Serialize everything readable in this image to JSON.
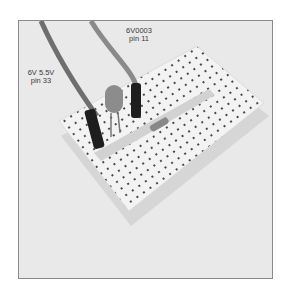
{
  "photo": {
    "subject": "Breadboard with LED, resistor and two jumper wires",
    "labels": [
      {
        "line1": "6V0003",
        "line2": "pin 11"
      },
      {
        "line1": "6V 5.5V",
        "line2": "pin 33"
      }
    ]
  },
  "colors": {
    "background": "#e9e9e9",
    "frame_border": "#8a8a8a",
    "breadboard": "#f5f5f5",
    "wire": "#6e6e6e",
    "connector": "#1e1e1e",
    "led": "#8c8c8c"
  }
}
